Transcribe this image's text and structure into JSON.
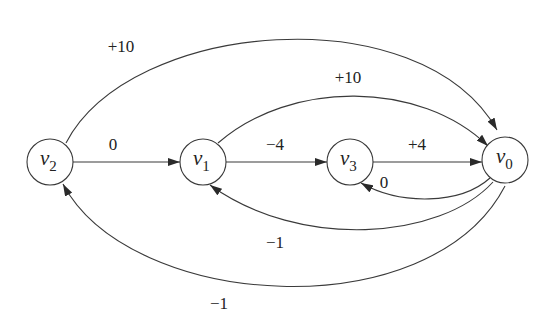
{
  "diagram": {
    "type": "directed-weighted-graph",
    "nodes": [
      {
        "id": "v2",
        "name": "v",
        "sub": "2"
      },
      {
        "id": "v1",
        "name": "v",
        "sub": "1"
      },
      {
        "id": "v3",
        "name": "v",
        "sub": "3"
      },
      {
        "id": "v0",
        "name": "v",
        "sub": "0"
      }
    ],
    "edges": [
      {
        "from": "v2",
        "to": "v1",
        "weight": "0"
      },
      {
        "from": "v1",
        "to": "v3",
        "weight": "−4"
      },
      {
        "from": "v3",
        "to": "v0",
        "weight": "+4"
      },
      {
        "from": "v2",
        "to": "v0",
        "weight": "+10"
      },
      {
        "from": "v1",
        "to": "v0",
        "weight": "+10"
      },
      {
        "from": "v0",
        "to": "v3",
        "weight": "0"
      },
      {
        "from": "v0",
        "to": "v1",
        "weight": "−1"
      },
      {
        "from": "v0",
        "to": "v2",
        "weight": "−1"
      }
    ]
  }
}
